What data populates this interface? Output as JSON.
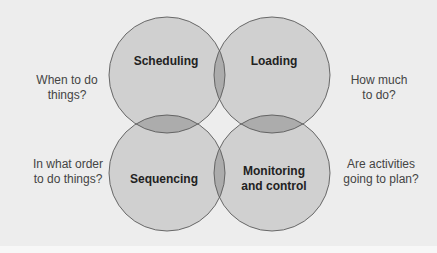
{
  "diagram": {
    "type": "venn-4",
    "circles": [
      {
        "id": "scheduling",
        "label": "Scheduling",
        "question": "When to do things?"
      },
      {
        "id": "loading",
        "label": "Loading",
        "question": "How much to do?"
      },
      {
        "id": "sequencing",
        "label": "Sequencing",
        "question": "In what order to do things?"
      },
      {
        "id": "monitoring",
        "label": "Monitoring and control",
        "question": "Are activities going to plan?"
      }
    ],
    "labels": {
      "scheduling": "Scheduling",
      "loading": "Loading",
      "sequencing": "Sequencing",
      "monitoring_line1": "Monitoring",
      "monitoring_line2": "and control"
    },
    "questions": {
      "scheduling_line1": "When to do",
      "scheduling_line2": "things?",
      "loading_line1": "How much",
      "loading_line2": "to do?",
      "sequencing_line1": "In what order",
      "sequencing_line2": "to do things?",
      "monitoring_line1": "Are activities",
      "monitoring_line2": "going to plan?"
    },
    "colors": {
      "background": "#ededed",
      "circle_fill": "#c8c8c8",
      "overlap2": "#a9a9a9",
      "overlap3": "#8c8c8c",
      "overlap4": "#666666",
      "stroke": "#555555"
    }
  }
}
